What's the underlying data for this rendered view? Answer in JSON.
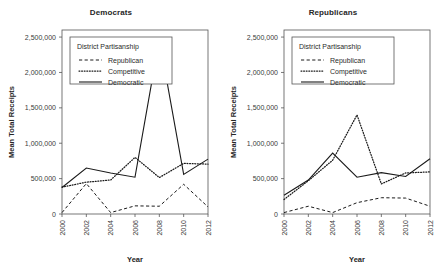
{
  "figure": {
    "panels": [
      "Democrats",
      "Republicans"
    ]
  },
  "chart_data": [
    {
      "type": "line",
      "title": "Democrats",
      "xlabel": "Year",
      "ylabel": "Mean Total Receipts",
      "x": [
        2000,
        2002,
        2004,
        2006,
        2008,
        2010,
        2012
      ],
      "xticklabels": [
        "2000",
        "2002",
        "2004",
        "2006",
        "2008",
        "2010",
        "2012"
      ],
      "yticklabels": [
        "0",
        "500,000",
        "1,000,000",
        "1,500,000",
        "2,000,000",
        "2,500,000"
      ],
      "yticks": [
        0,
        500000,
        1000000,
        1500000,
        2000000,
        2500000
      ],
      "xlim": [
        2000,
        2012
      ],
      "ylim": [
        0,
        2600000
      ],
      "grid": false,
      "legend_title": "District Partisanship",
      "legend_position": "upper-left-inside",
      "series": [
        {
          "name": "Republican",
          "style": "dashed",
          "values": [
            20000,
            430000,
            20000,
            115000,
            110000,
            420000,
            100000
          ]
        },
        {
          "name": "Competitive",
          "style": "dotted",
          "values": [
            380000,
            450000,
            480000,
            800000,
            515000,
            715000,
            705000
          ]
        },
        {
          "name": "Democratic",
          "style": "solid",
          "values": [
            375000,
            650000,
            580000,
            520000,
            2470000,
            560000,
            775000
          ]
        }
      ]
    },
    {
      "type": "line",
      "title": "Republicans",
      "xlabel": "Year",
      "ylabel": "Mean Total Receipts",
      "x": [
        2000,
        2002,
        2004,
        2006,
        2008,
        2010,
        2012
      ],
      "xticklabels": [
        "2000",
        "2002",
        "2004",
        "2006",
        "2008",
        "2010",
        "2012"
      ],
      "yticklabels": [
        "0",
        "500,000",
        "1,000,000",
        "1,500,000",
        "2,000,000",
        "2,500,000"
      ],
      "yticks": [
        0,
        500000,
        1000000,
        1500000,
        2000000,
        2500000
      ],
      "xlim": [
        2000,
        2012
      ],
      "ylim": [
        0,
        2600000
      ],
      "grid": false,
      "legend_title": "District Partisanship",
      "legend_position": "upper-left-inside",
      "series": [
        {
          "name": "Republican",
          "style": "dashed",
          "values": [
            20000,
            110000,
            20000,
            160000,
            230000,
            225000,
            110000
          ]
        },
        {
          "name": "Competitive",
          "style": "dotted",
          "values": [
            205000,
            470000,
            760000,
            1400000,
            425000,
            580000,
            595000
          ]
        },
        {
          "name": "Democratic",
          "style": "solid",
          "values": [
            265000,
            480000,
            860000,
            520000,
            585000,
            530000,
            780000
          ]
        }
      ]
    }
  ]
}
